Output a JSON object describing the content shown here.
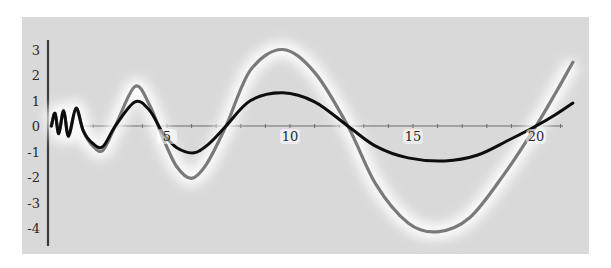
{
  "chart_data": {
    "type": "line",
    "title": "",
    "xlabel": "",
    "ylabel": "",
    "xlim": [
      0,
      21.5
    ],
    "ylim": [
      -4.5,
      3.5
    ],
    "grid": false,
    "legend": null,
    "x_ticks": [
      5,
      10,
      15,
      20
    ],
    "x_tick_labels": [
      "5",
      "10",
      "15",
      "20"
    ],
    "y_ticks": [
      3,
      2,
      1,
      0,
      -1,
      -2,
      -3,
      -4
    ],
    "y_tick_labels": [
      "3",
      "2",
      "1",
      "0",
      "-1",
      "-2",
      "-3",
      "-4"
    ],
    "series": [
      {
        "name": "gray-curve",
        "color": "#7a7a7a",
        "glow": true,
        "points": [
          [
            0.3,
            0.0
          ],
          [
            0.45,
            0.5
          ],
          [
            0.6,
            -0.3
          ],
          [
            0.8,
            0.6
          ],
          [
            1.0,
            -0.4
          ],
          [
            1.3,
            0.7
          ],
          [
            1.6,
            -0.2
          ],
          [
            2.0,
            -0.8
          ],
          [
            2.4,
            -0.95
          ],
          [
            2.9,
            0.0
          ],
          [
            3.7,
            1.55
          ],
          [
            4.3,
            0.8
          ],
          [
            4.85,
            -0.5
          ],
          [
            5.4,
            -1.6
          ],
          [
            6.0,
            -2.05
          ],
          [
            6.6,
            -1.5
          ],
          [
            7.4,
            0.0
          ],
          [
            8.4,
            2.2
          ],
          [
            9.7,
            3.0
          ],
          [
            11.0,
            2.1
          ],
          [
            12.35,
            0.0
          ],
          [
            13.5,
            -2.3
          ],
          [
            14.8,
            -3.8
          ],
          [
            16.0,
            -4.15
          ],
          [
            17.3,
            -3.6
          ],
          [
            18.7,
            -1.9
          ],
          [
            20.0,
            0.0
          ],
          [
            20.8,
            1.3
          ],
          [
            21.5,
            2.5
          ]
        ]
      },
      {
        "name": "black-curve",
        "color": "#0d0d0d",
        "glow": false,
        "points": [
          [
            0.3,
            0.0
          ],
          [
            0.45,
            0.5
          ],
          [
            0.6,
            -0.3
          ],
          [
            0.8,
            0.6
          ],
          [
            1.0,
            -0.4
          ],
          [
            1.3,
            0.7
          ],
          [
            1.6,
            -0.2
          ],
          [
            2.0,
            -0.7
          ],
          [
            2.4,
            -0.8
          ],
          [
            2.9,
            0.0
          ],
          [
            3.7,
            0.95
          ],
          [
            4.3,
            0.6
          ],
          [
            4.85,
            -0.3
          ],
          [
            5.4,
            -0.85
          ],
          [
            6.1,
            -1.05
          ],
          [
            6.7,
            -0.7
          ],
          [
            7.4,
            0.0
          ],
          [
            8.4,
            1.0
          ],
          [
            9.7,
            1.3
          ],
          [
            11.0,
            0.95
          ],
          [
            12.35,
            0.0
          ],
          [
            13.5,
            -0.8
          ],
          [
            14.8,
            -1.25
          ],
          [
            16.3,
            -1.37
          ],
          [
            17.6,
            -1.15
          ],
          [
            18.9,
            -0.55
          ],
          [
            20.0,
            0.0
          ],
          [
            20.8,
            0.45
          ],
          [
            21.5,
            0.9
          ]
        ]
      }
    ]
  }
}
